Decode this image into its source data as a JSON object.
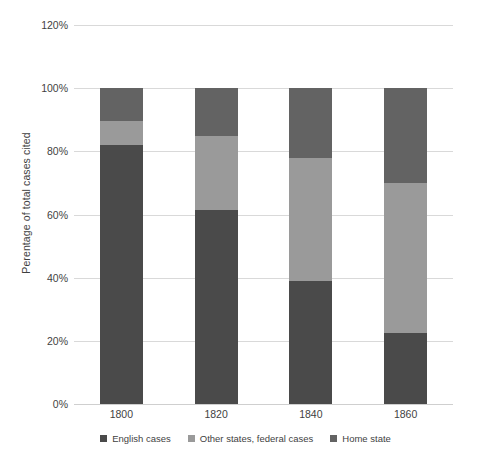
{
  "chart_data": {
    "type": "bar",
    "subtype": "stacked-percentage-column",
    "title": "",
    "subtitle": "",
    "xlabel": "",
    "ylabel": "Perentage of total cases cited",
    "categories": [
      "1800",
      "1820",
      "1840",
      "1860"
    ],
    "ylim": [
      0,
      120
    ],
    "ytick_labels": [
      "0%",
      "20%",
      "40%",
      "60%",
      "80%",
      "100%",
      "120%"
    ],
    "ytick_values": [
      0,
      20,
      40,
      60,
      80,
      100,
      120
    ],
    "grid": true,
    "legend_position": "bottom",
    "series": [
      {
        "name": "English cases",
        "color": "#4a4a4a",
        "values": [
          82,
          61.5,
          39,
          22.5
        ]
      },
      {
        "name": "Other states, federal cases",
        "color": "#9a9a9a",
        "values": [
          7.5,
          23.5,
          39,
          47.5
        ]
      },
      {
        "name": "Home state",
        "color": "#636363",
        "values": [
          10.5,
          15,
          22,
          30
        ]
      }
    ],
    "stack_order_bottom_to_top": [
      "English cases",
      "Other states, federal cases",
      "Home state"
    ],
    "annotations": []
  },
  "axis": {
    "y_title": "Perentage of total cases cited",
    "y_ticks": [
      {
        "label": "120%",
        "value": 120
      },
      {
        "label": "100%",
        "value": 100
      },
      {
        "label": "80%",
        "value": 80
      },
      {
        "label": "60%",
        "value": 60
      },
      {
        "label": "40%",
        "value": 40
      },
      {
        "label": "20%",
        "value": 20
      },
      {
        "label": "0%",
        "value": 0
      }
    ],
    "x_ticks": [
      {
        "label": "1800"
      },
      {
        "label": "1820"
      },
      {
        "label": "1840"
      },
      {
        "label": "1860"
      }
    ]
  },
  "legend": {
    "items": [
      {
        "label": "English cases",
        "color": "#4a4a4a"
      },
      {
        "label": "Other states, federal cases",
        "color": "#9a9a9a"
      },
      {
        "label": "Home state",
        "color": "#636363"
      }
    ]
  },
  "colors": {
    "english_cases": "#4a4a4a",
    "other_states_federal_cases": "#9a9a9a",
    "home_state": "#636363",
    "gridline": "#d9d9d9",
    "text": "#3f3f3f",
    "background": "#ffffff"
  }
}
